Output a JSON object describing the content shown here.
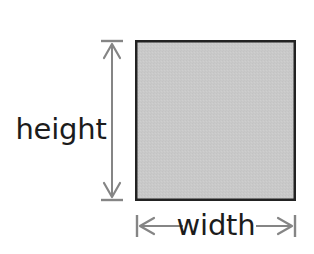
{
  "diagram": {
    "canvas": {
      "width": 314,
      "height": 254,
      "background": "#ffffff"
    },
    "shape": {
      "kind": "rectangle",
      "name": "shaded-rectangle",
      "x": 135,
      "y": 40,
      "width": 161,
      "height": 161,
      "fill_color": "#c9c9c9",
      "stroke_color": "#222222",
      "stroke_width": 2.5
    },
    "dimensions": [
      {
        "id": "height",
        "label": "height",
        "orientation": "vertical",
        "label_x": 61,
        "label_y": 131,
        "line_x": 112,
        "line_start": 46,
        "line_end": 196,
        "cap_start": 40,
        "cap_end": 201,
        "cap_half_length": 11,
        "arrow_color": "#858585",
        "arrow_width": 2
      },
      {
        "id": "width",
        "label": "width",
        "orientation": "horizontal",
        "label_x": 216,
        "label_y": 236,
        "line_y": 226,
        "line_start": 142,
        "line_end": 290,
        "cap_start": 136,
        "cap_end": 296,
        "cap_half_length": 11,
        "gap_left": 183,
        "gap_right": 256,
        "arrow_color": "#858585",
        "arrow_width": 2
      }
    ],
    "colors": {
      "fill": "#c9c9c9",
      "stroke": "#222222",
      "arrow": "#858585",
      "text": "#1c1c1c",
      "background": "#ffffff"
    }
  }
}
